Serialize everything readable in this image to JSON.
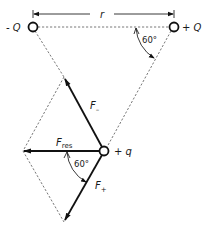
{
  "diagram": {
    "charges": {
      "neg_Q": {
        "label": "- Q",
        "x": 33,
        "y": 27
      },
      "pos_Q": {
        "label": "+ Q",
        "x": 174,
        "y": 27
      },
      "test_q": {
        "label": "+ q",
        "x": 104,
        "y": 151
      }
    },
    "distance_label": "r",
    "angles": {
      "top": "60°",
      "bottom": "60°"
    },
    "forces": {
      "f_minus": {
        "label": "F",
        "subscript": "–"
      },
      "f_plus": {
        "label": "F",
        "subscript": "+"
      },
      "f_res": {
        "label": "F",
        "subscript": "res"
      }
    }
  }
}
